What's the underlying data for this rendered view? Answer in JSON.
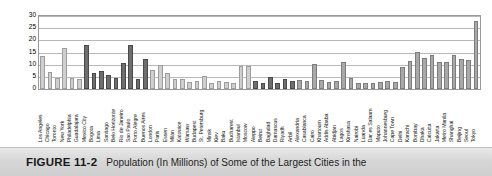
{
  "figure": {
    "number_label": "FIGURE 11-2",
    "caption_text": "Population (In Millions) of Some of the Largest Cities in the"
  },
  "chart_data": {
    "type": "bar",
    "title": "",
    "subtitle": "",
    "xlabel": "",
    "ylabel": "",
    "ylim": [
      0,
      30
    ],
    "yticks": [
      0,
      5,
      10,
      15,
      20,
      25,
      30
    ],
    "grid": true,
    "legend": "none",
    "units": "millions",
    "categories": [
      "Los Angeles",
      "Chicago",
      "Toronto",
      "New York",
      "Philadelphia",
      "Guadalajara",
      "Mexico City",
      "Bogota",
      "Lima",
      "Santiago",
      "Belo Horizonte",
      "Rio de Janeiro",
      "Sao Paulo",
      "Porto Alegre",
      "Buenos Aires",
      "London",
      "Paris",
      "Essen",
      "Milan",
      "Katowice",
      "Warsaw",
      "Budapest",
      "St. Petersburg",
      "Minsk",
      "Kiev",
      "Baku",
      "Bucharest",
      "Istanbul",
      "Moscow",
      "Aleppo",
      "Beirut",
      "Baghdad",
      "Damascus",
      "Riyadh",
      "Arbil",
      "Alexandria",
      "Casablanca",
      "Cairo",
      "Khartoum",
      "Addis Ababa",
      "Abidjan",
      "Lagos",
      "Kinshasa",
      "Nairobi",
      "Luanda",
      "Dar es Salaam",
      "Maputo",
      "Johannesburg",
      "Cape Town",
      "Delhi",
      "Karachi",
      "Bombay",
      "Dhaka",
      "Calcutta",
      "Jakarta",
      "Metro Manila",
      "Shanghai",
      "Beijing",
      "Seoul",
      "Tokyo"
    ],
    "values": [
      13.5,
      7.0,
      4.6,
      16.8,
      4.4,
      4.2,
      18.1,
      6.5,
      7.5,
      5.6,
      4.7,
      10.7,
      18.0,
      4.3,
      12.4,
      8.0,
      9.7,
      6.7,
      4.3,
      4.0,
      3.0,
      3.1,
      5.4,
      2.5,
      3.4,
      3.0,
      2.6,
      9.6,
      9.3,
      3.2,
      2.6,
      5.0,
      2.6,
      4.3,
      3.1,
      3.6,
      3.4,
      10.1,
      3.5,
      3.0,
      3.1,
      10.9,
      4.7,
      2.4,
      2.6,
      2.6,
      2.8,
      3.4,
      3.0,
      9.2,
      11.5,
      15.1,
      12.6,
      13.9,
      11.3,
      11.0,
      14.1,
      12.4,
      11.9,
      28.0
    ],
    "bar_shades": [
      "light",
      "light",
      "light",
      "light",
      "light",
      "light",
      "dark",
      "dark",
      "dark",
      "dark",
      "dark",
      "dark",
      "dark",
      "dark",
      "dark",
      "light",
      "light",
      "light",
      "light",
      "light",
      "light",
      "light",
      "light",
      "light",
      "light",
      "light",
      "light",
      "light",
      "light",
      "dark",
      "dark",
      "dark",
      "dark",
      "dark",
      "dark",
      "mid",
      "mid",
      "mid",
      "mid",
      "mid",
      "mid",
      "mid",
      "mid",
      "mid",
      "mid",
      "mid",
      "mid",
      "mid",
      "mid",
      "mid",
      "mid",
      "mid",
      "mid",
      "mid",
      "mid",
      "mid",
      "mid",
      "mid",
      "mid",
      "mid"
    ],
    "colors": {
      "light": "#cfcfcf",
      "mid": "#a8a8a8",
      "dark": "#6e6e6e",
      "gridline": "#b8b8b8",
      "frame": "#9a9a9a"
    }
  }
}
